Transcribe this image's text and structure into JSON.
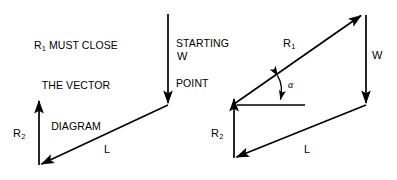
{
  "figure": {
    "title_note": {
      "line1_prefix": "R",
      "line1_sub": "1",
      "line1_rest": " MUST CLOSE",
      "line2": "THE VECTOR",
      "line3": "DIAGRAM"
    },
    "starting_point_caption": {
      "line1": "STARTING",
      "line2": "POINT"
    },
    "background_color": "#ffffff",
    "stroke_color": "#000000"
  },
  "left_diagram": {
    "name": "open-vector-diagram",
    "labels": {
      "w": "W",
      "l": "L",
      "r2_prefix": "R",
      "r2_sub": "2"
    },
    "vectors": [
      {
        "name": "W",
        "from": [
          168,
          14
        ],
        "to": [
          168,
          105
        ],
        "direction": "down"
      },
      {
        "name": "L",
        "from": [
          168,
          105
        ],
        "to": [
          39,
          165
        ],
        "direction": "down-left"
      },
      {
        "name": "R2",
        "from": [
          39,
          165
        ],
        "to": [
          39,
          100
        ],
        "direction": "up"
      }
    ]
  },
  "right_diagram": {
    "name": "closed-vector-diagram",
    "labels": {
      "r1_prefix": "R",
      "r1_sub": "1",
      "w": "W",
      "l": "L",
      "r2_prefix": "R",
      "r2_sub": "2",
      "alpha": "α"
    },
    "vectors": [
      {
        "name": "R1",
        "from": [
          234,
          104
        ],
        "to": [
          363,
          14
        ],
        "direction": "up-right"
      },
      {
        "name": "W",
        "from": [
          366,
          15
        ],
        "to": [
          366,
          105
        ],
        "direction": "down"
      },
      {
        "name": "L",
        "from": [
          366,
          105
        ],
        "to": [
          234,
          158
        ],
        "direction": "down-left"
      },
      {
        "name": "R2",
        "from": [
          234,
          158
        ],
        "to": [
          234,
          98
        ],
        "direction": "up"
      }
    ],
    "reference_line": {
      "from": [
        237,
        105
      ],
      "to": [
        305,
        105
      ]
    },
    "angle_marker": {
      "symbol": "α",
      "between": [
        "reference-line",
        "R1"
      ]
    }
  }
}
